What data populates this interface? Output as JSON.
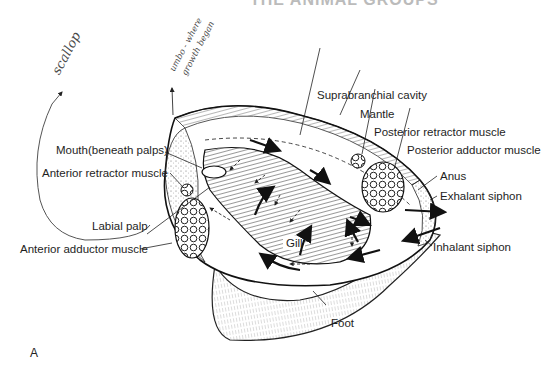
{
  "header_fragment": "THE ANIMAL GROUPS",
  "panel_letter": "A",
  "handwritten": {
    "scallop": "scallop",
    "umbo_line1": "umbo - where",
    "umbo_line2": "growth began"
  },
  "labels": {
    "suprabranchial_cavity": "Suprabranchial cavity",
    "mantle": "Mantle",
    "posterior_retractor_muscle": "Posterior retractor muscle",
    "posterior_adductor_muscle": "Posterior adductor muscle",
    "anus": "Anus",
    "exhalant_siphon": "Exhalant siphon",
    "inhalant_siphon": "Inhalant siphon",
    "mouth": "Mouth(beneath palps)",
    "anterior_retractor_muscle": "Anterior retractor muscle",
    "labial_palp": "Labial palp",
    "anterior_adductor_muscle": "Anterior adductor muscle",
    "gill": "Gill",
    "foot": "Foot"
  },
  "colors": {
    "ink": "#1e1e1e",
    "pencil": "#4a4a4a",
    "background": "#ffffff"
  }
}
